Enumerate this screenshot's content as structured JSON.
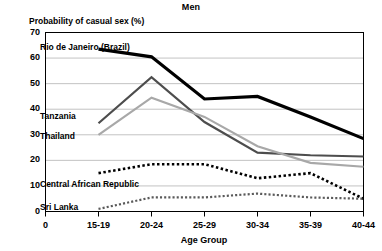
{
  "chart_data": {
    "type": "line",
    "title": "Men",
    "ylabel": "Probability of casual sex (%)",
    "xlabel": "Age Group",
    "categories": [
      "15-19",
      "20-24",
      "25-29",
      "30-34",
      "35-39",
      "40-44"
    ],
    "xtick_labels": [
      "0",
      "15-19",
      "20-24",
      "25-29",
      "30-34",
      "35-39",
      "40-44"
    ],
    "ytick_labels": [
      "0",
      "10",
      "20",
      "30",
      "40",
      "50",
      "60",
      "70"
    ],
    "ylim": [
      0,
      70
    ],
    "grid": "horizontal",
    "legend_position": "inline-annotations",
    "series": [
      {
        "name": "Rio de Janeiro (Brazil)",
        "values": [
          63.5,
          60.5,
          44.0,
          45.0,
          37.0,
          28.5
        ],
        "color": "#000000",
        "style": "solid",
        "width": 3.2
      },
      {
        "name": "Tanzania",
        "values": [
          34.5,
          52.5,
          35.0,
          23.0,
          22.0,
          21.5
        ],
        "color": "#4d4d4d",
        "style": "solid",
        "width": 2.2
      },
      {
        "name": "Thailand",
        "values": [
          30.0,
          44.5,
          37.0,
          25.5,
          19.0,
          17.5
        ],
        "color": "#a8a8a8",
        "style": "solid",
        "width": 2.2
      },
      {
        "name": "Central African Republic",
        "values": [
          15.0,
          18.5,
          18.5,
          13.0,
          15.0,
          5.0
        ],
        "color": "#000000",
        "style": "dotted",
        "width": 2.6
      },
      {
        "name": "Sri Lanka",
        "values": [
          1.0,
          5.5,
          5.5,
          7.0,
          5.5,
          5.0
        ],
        "color": "#5a5a5a",
        "style": "dotted",
        "width": 2.2
      }
    ],
    "annotations": [
      {
        "label": "Rio de Janeiro (Brazil)",
        "x": 40,
        "y": 42
      },
      {
        "label": "Tanzania",
        "x": 40,
        "y": 111
      },
      {
        "label": "Thailand",
        "x": 40,
        "y": 131
      },
      {
        "label": "Central African Republic",
        "x": 40,
        "y": 179
      },
      {
        "label": "Sri Lanka",
        "x": 40,
        "y": 202
      }
    ]
  }
}
